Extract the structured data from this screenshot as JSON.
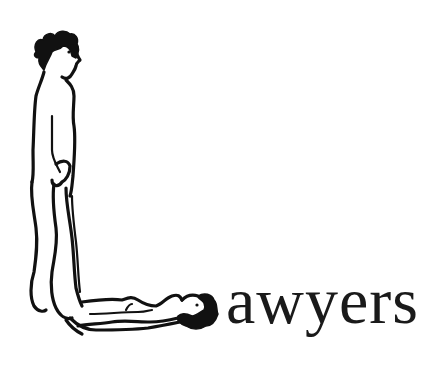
{
  "artwork": {
    "drop_cap_letter": "L",
    "drop_cap_description": "Letter L formed by two nude line-drawn figures: one standing upright, one lying horizontally",
    "word_remainder": "awyers",
    "full_word": "Lawyers",
    "colors": {
      "ink": "#111111",
      "background": "#ffffff"
    }
  }
}
